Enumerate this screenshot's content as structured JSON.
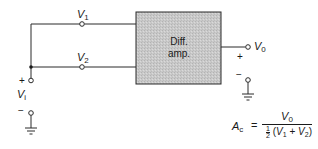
{
  "diagram": {
    "type": "circuit-schematic",
    "block": {
      "line1": "Diff.",
      "line2": "amp.",
      "fill": "#c8c8c8"
    },
    "inputs": [
      {
        "id": "v1",
        "label_main": "V",
        "label_sub": "1"
      },
      {
        "id": "v2",
        "label_main": "V",
        "label_sub": "2"
      }
    ],
    "source": {
      "label_main": "V",
      "label_sub": "i",
      "plus": "+",
      "minus": "−"
    },
    "output": {
      "label_main": "V",
      "label_sub": "0",
      "plus": "+",
      "minus": "−"
    },
    "formula": {
      "lhs_main": "A",
      "lhs_sub": "c",
      "equals": "=",
      "numerator_main": "V",
      "numerator_sub": "0",
      "denominator_half_num": "1",
      "denominator_half_den": "2",
      "denominator_open": "(",
      "denominator_v1_main": "V",
      "denominator_v1_sub": "1",
      "denominator_plus": "+",
      "denominator_v2_main": "V",
      "denominator_v2_sub": "2",
      "denominator_close": ")"
    },
    "line_color": "#2a2a2a"
  }
}
